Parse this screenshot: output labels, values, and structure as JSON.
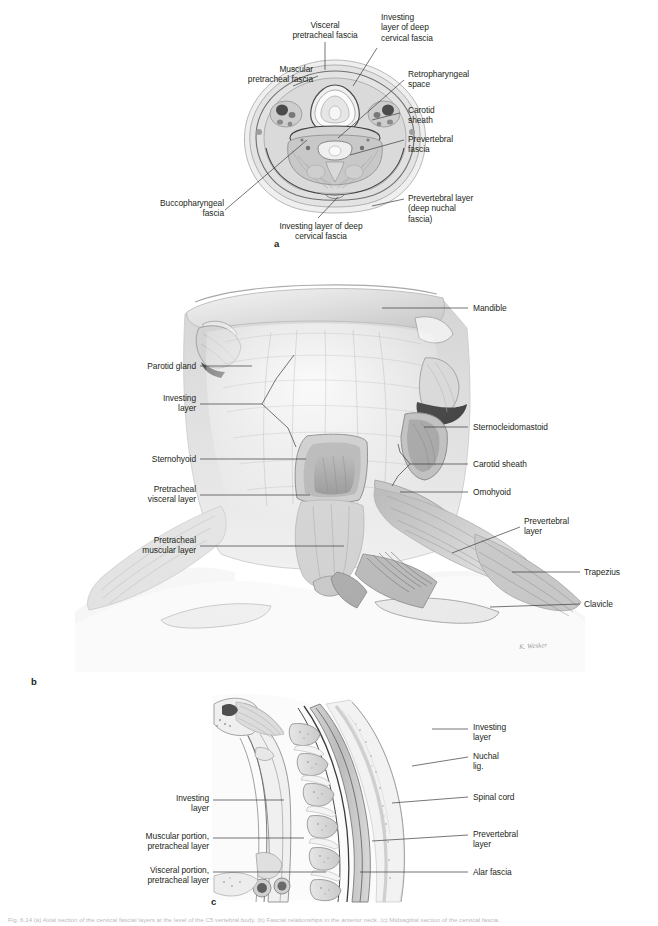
{
  "figure": {
    "panels": [
      {
        "letter": "a",
        "kind": "axial-cross-section"
      },
      {
        "letter": "b",
        "kind": "anterior-neck-dissection"
      },
      {
        "letter": "c",
        "kind": "midsagittal-section"
      }
    ],
    "caption": "Fig. 6.14 (a) Axial section of the cervical fascial layers at the level of the C5 vertebral body. (b) Fascial relationships in the anterior neck. (c) Midsagittal section of the cervical fascia."
  },
  "panel_a": {
    "letter": "a",
    "labels": [
      {
        "id": "visceral-pretracheal-fascia",
        "text": "Visceral\npretracheal fascia",
        "align": "center"
      },
      {
        "id": "investing-layer-deep-cervical-fascia-top",
        "text": "Investing\nlayer of deep\ncervical fascia",
        "align": "left"
      },
      {
        "id": "muscular-pretracheal-fascia",
        "text": "Muscular\npretracheal fascia",
        "align": "right"
      },
      {
        "id": "retropharyngeal-space",
        "text": "Retropharyngeal\nspace",
        "align": "left"
      },
      {
        "id": "carotid-sheath",
        "text": "Carotid\nsheath",
        "align": "left"
      },
      {
        "id": "prevertebral-fascia",
        "text": "Prevertebral\nfascia",
        "align": "left"
      },
      {
        "id": "prevertebral-layer-deep-nuchal-fascia",
        "text": "Prevertebral layer\n(deep nuchal\nfascia)",
        "align": "left"
      },
      {
        "id": "buccopharyngeal-fascia",
        "text": "Buccopharyngeal\nfascia",
        "align": "right"
      },
      {
        "id": "investing-layer-deep-cervical-fascia-bottom",
        "text": "Investing layer of deep\ncervical fascia",
        "align": "center"
      }
    ]
  },
  "panel_b": {
    "letter": "b",
    "labels": [
      {
        "id": "mandible",
        "text": "Mandible",
        "align": "left"
      },
      {
        "id": "parotid-gland",
        "text": "Parotid gland",
        "align": "right"
      },
      {
        "id": "investing-layer",
        "text": "Investing\nlayer",
        "align": "right"
      },
      {
        "id": "sternocleidomastoid",
        "text": "Sternocleidomastoid",
        "align": "left"
      },
      {
        "id": "sternohyoid",
        "text": "Sternohyoid",
        "align": "right"
      },
      {
        "id": "carotid-sheath",
        "text": "Carotid sheath",
        "align": "left"
      },
      {
        "id": "pretracheal-visceral-layer",
        "text": "Pretracheal\nvisceral layer",
        "align": "right"
      },
      {
        "id": "omohyoid",
        "text": "Omohyoid",
        "align": "left"
      },
      {
        "id": "prevertebral-layer",
        "text": "Prevertebral\nlayer",
        "align": "left"
      },
      {
        "id": "pretracheal-muscular-layer",
        "text": "Pretracheal\nmuscular layer",
        "align": "right"
      },
      {
        "id": "trapezius",
        "text": "Trapezius",
        "align": "left"
      },
      {
        "id": "clavicle",
        "text": "Clavicle",
        "align": "left"
      }
    ],
    "artist_signature": "K. Wesker"
  },
  "panel_c": {
    "letter": "c",
    "labels": [
      {
        "id": "investing-layer-right",
        "text": "Investing\nlayer",
        "align": "left"
      },
      {
        "id": "nuchal-lig",
        "text": "Nuchal\nlig.",
        "align": "left"
      },
      {
        "id": "spinal-cord",
        "text": "Spinal cord",
        "align": "left"
      },
      {
        "id": "prevertebral-layer",
        "text": "Prevertebral\nlayer",
        "align": "left"
      },
      {
        "id": "alar-fascia",
        "text": "Alar fascia",
        "align": "left"
      },
      {
        "id": "investing-layer-left",
        "text": "Investing\nlayer",
        "align": "right"
      },
      {
        "id": "muscular-portion-pretracheal-layer",
        "text": "Muscular portion,\npretracheal layer",
        "align": "right"
      },
      {
        "id": "visceral-portion-pretracheal-layer",
        "text": "Visceral portion,\npretracheal layer",
        "align": "right"
      }
    ]
  },
  "colors": {
    "text": "#231f20",
    "leader": "#3b3b3f",
    "background": "#ffffff",
    "tissue_light": "#e8e8e8",
    "tissue_mid": "#c9c9c9",
    "tissue_dark": "#8f8f8f",
    "outline": "#4a4a4a"
  }
}
